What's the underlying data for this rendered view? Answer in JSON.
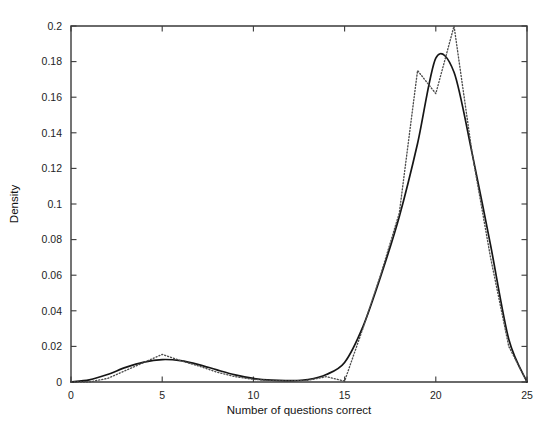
{
  "chart_data": {
    "type": "line",
    "title": "",
    "xlabel": "Number of questions correct",
    "ylabel": "Density",
    "xlim": [
      0,
      25
    ],
    "ylim": [
      0,
      0.2
    ],
    "grid": false,
    "legend": "none",
    "x_ticks": [
      "0",
      "5",
      "10",
      "15",
      "20",
      "25"
    ],
    "x_tick_values": [
      0,
      5,
      10,
      15,
      20,
      25
    ],
    "y_ticks": [
      "0",
      "0.02",
      "0.04",
      "0.06",
      "0.08",
      "0.1",
      "0.12",
      "0.14",
      "0.16",
      "0.18",
      "0.2"
    ],
    "y_tick_values": [
      0,
      0.02,
      0.04,
      0.06,
      0.08,
      0.1,
      0.12,
      0.14,
      0.16,
      0.18,
      0.2
    ],
    "x": [
      0,
      1,
      2,
      3,
      4,
      5,
      6,
      7,
      8,
      9,
      10,
      11,
      12,
      13,
      14,
      15,
      16,
      17,
      18,
      19,
      20,
      21,
      22,
      23,
      24,
      25
    ],
    "series": [
      {
        "name": "fitted-density",
        "style": "solid",
        "color": "#161616",
        "values": [
          0.0,
          0.0012,
          0.0042,
          0.0082,
          0.0112,
          0.0126,
          0.012,
          0.0098,
          0.0068,
          0.004,
          0.002,
          0.001,
          0.0008,
          0.0014,
          0.0042,
          0.011,
          0.031,
          0.06,
          0.093,
          0.134,
          0.182,
          0.174,
          0.128,
          0.077,
          0.024,
          0.0
        ]
      },
      {
        "name": "empirical-density",
        "style": "dotted",
        "color": "#4d4d4d",
        "values": [
          0.0,
          0.0,
          0.002,
          0.0065,
          0.011,
          0.0155,
          0.012,
          0.009,
          0.0055,
          0.003,
          0.0015,
          0.0008,
          0.0006,
          0.001,
          0.003,
          0.0005,
          0.03,
          0.061,
          0.095,
          0.175,
          0.162,
          0.2,
          0.128,
          0.07,
          0.02,
          0.0
        ]
      }
    ]
  }
}
